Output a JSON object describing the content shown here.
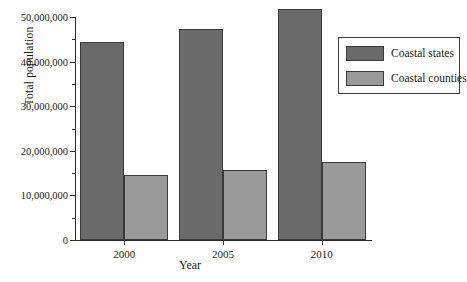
{
  "chart_data": {
    "type": "bar",
    "title": "",
    "xlabel": "Year",
    "ylabel": "Total population",
    "categories": [
      "2000",
      "2005",
      "2010"
    ],
    "series": [
      {
        "name": "Coastal states",
        "values": [
          44500000,
          47400000,
          51800000
        ],
        "color": "#6a6a6a"
      },
      {
        "name": "Coastal counties",
        "values": [
          14500000,
          15800000,
          17600000
        ],
        "color": "#9a9a9a"
      }
    ],
    "ylim": [
      0,
      50000000
    ],
    "ytick_labels": [
      "0",
      "10,000,000",
      "20,000,000",
      "30,000,000",
      "40,000,000",
      "50,000,000"
    ],
    "ytick_values": [
      0,
      10000000,
      20000000,
      30000000,
      40000000,
      50000000
    ],
    "yminor_values": [
      5000000,
      15000000,
      25000000,
      35000000,
      45000000
    ],
    "grid": false,
    "legend_position": "upper right"
  }
}
